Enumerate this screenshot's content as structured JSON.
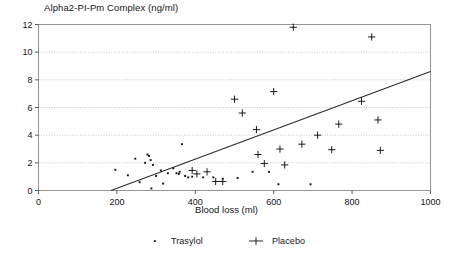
{
  "chart_data": {
    "type": "scatter",
    "title": "Alpha2-PI-Pm Complex (ng/ml)",
    "xlabel": "Blood loss (ml)",
    "ylabel": "",
    "xlim": [
      0,
      1000
    ],
    "ylim": [
      0,
      12
    ],
    "xticks": [
      0,
      200,
      400,
      600,
      800,
      1000
    ],
    "yticks": [
      0,
      2,
      4,
      6,
      8,
      10,
      12
    ],
    "grid": "horizontal-dotted",
    "legend_position": "bottom-center",
    "series": [
      {
        "name": "Trasylol",
        "marker": "dot",
        "color": "#101010",
        "points": [
          [
            196,
            1.5
          ],
          [
            228,
            1.1
          ],
          [
            247,
            2.3
          ],
          [
            258,
            0.6
          ],
          [
            272,
            2.0
          ],
          [
            278,
            2.6
          ],
          [
            282,
            2.5
          ],
          [
            286,
            2.2
          ],
          [
            288,
            0.15
          ],
          [
            292,
            1.85
          ],
          [
            300,
            1.05
          ],
          [
            312,
            1.45
          ],
          [
            318,
            0.5
          ],
          [
            330,
            1.25
          ],
          [
            344,
            1.6
          ],
          [
            352,
            1.25
          ],
          [
            358,
            1.2
          ],
          [
            360,
            1.35
          ],
          [
            366,
            3.35
          ],
          [
            374,
            1.05
          ],
          [
            382,
            0.95
          ],
          [
            392,
            1.0
          ],
          [
            420,
            0.95
          ],
          [
            446,
            0.95
          ],
          [
            470,
            0.85
          ],
          [
            508,
            0.9
          ],
          [
            546,
            1.35
          ],
          [
            588,
            1.35
          ],
          [
            612,
            0.45
          ],
          [
            694,
            0.45
          ]
        ]
      },
      {
        "name": "Placebo",
        "marker": "plus",
        "color": "#101010",
        "points": [
          [
            392,
            1.45
          ],
          [
            404,
            1.2
          ],
          [
            430,
            1.35
          ],
          [
            452,
            0.65
          ],
          [
            470,
            0.65
          ],
          [
            500,
            6.6
          ],
          [
            520,
            5.6
          ],
          [
            556,
            4.4
          ],
          [
            560,
            2.6
          ],
          [
            576,
            1.95
          ],
          [
            600,
            7.15
          ],
          [
            616,
            3.0
          ],
          [
            628,
            1.85
          ],
          [
            650,
            11.8
          ],
          [
            672,
            3.35
          ],
          [
            712,
            4.0
          ],
          [
            748,
            2.95
          ],
          [
            766,
            4.8
          ],
          [
            824,
            6.45
          ],
          [
            850,
            11.1
          ],
          [
            866,
            5.1
          ],
          [
            872,
            2.9
          ]
        ]
      }
    ],
    "trendline": {
      "name": "regression-line",
      "x_start": 185,
      "y_start": 0,
      "x_end": 1000,
      "y_end": 8.6
    }
  },
  "legend": {
    "entries": [
      {
        "label": "Trasylol",
        "marker": "dot"
      },
      {
        "label": "Placebo",
        "marker": "plus"
      }
    ]
  }
}
